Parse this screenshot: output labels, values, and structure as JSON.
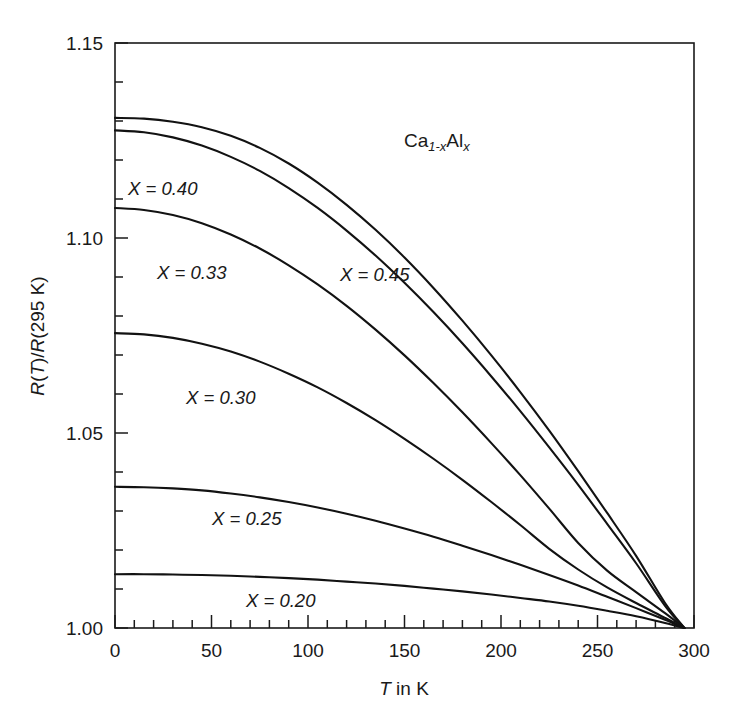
{
  "chart_data": {
    "type": "line",
    "title": "",
    "xlabel": "T in K",
    "ylabel": "R(T)/R(295 K)",
    "xlim": [
      0,
      300
    ],
    "ylim": [
      1.0,
      1.15
    ],
    "grid": false,
    "legend_position": "inline-annotations",
    "x_ticks_major": [
      0,
      50,
      100,
      150,
      200,
      250,
      300
    ],
    "x_tick_labels": [
      "0",
      "50",
      "100",
      "150",
      "200",
      "250",
      "300"
    ],
    "x_minor_step": 10,
    "y_ticks_major": [
      1.0,
      1.05,
      1.1,
      1.15
    ],
    "y_tick_labels": [
      "1.00",
      "1.05",
      "1.10",
      "1.15"
    ],
    "y_minor_step": 0.01,
    "annotation": "Ca1-xAlx",
    "annotation_parts": {
      "base1": "Ca",
      "sub1": "1-x",
      "base2": "Al",
      "sub2": "x"
    },
    "normalization_point": {
      "x": 295,
      "y": 1.0
    },
    "x": [
      0,
      15,
      30,
      45,
      60,
      75,
      90,
      105,
      120,
      135,
      150,
      165,
      180,
      195,
      210,
      225,
      240,
      255,
      270,
      285,
      295
    ],
    "series": [
      {
        "name": "X = 0.45",
        "label": "X = 0.45",
        "x_value": 0.45,
        "values": [
          1.1308,
          1.1306,
          1.1298,
          1.1284,
          1.1262,
          1.1231,
          1.1191,
          1.1142,
          1.1085,
          1.1021,
          1.095,
          1.0872,
          1.0788,
          1.0699,
          1.0605,
          1.0506,
          1.0402,
          1.0295,
          1.0185,
          1.0064,
          1.0
        ]
      },
      {
        "name": "X = 0.40",
        "label": "X = 0.40",
        "x_value": 0.4,
        "values": [
          1.1276,
          1.1271,
          1.1258,
          1.1237,
          1.1208,
          1.1172,
          1.1128,
          1.1077,
          1.1019,
          1.0955,
          1.0885,
          1.081,
          1.073,
          1.0645,
          1.0556,
          1.0463,
          1.0367,
          1.0267,
          1.0166,
          1.0057,
          1.0
        ]
      },
      {
        "name": "X = 0.33",
        "label": "X = 0.33",
        "x_value": 0.33,
        "values": [
          1.1077,
          1.1072,
          1.1059,
          1.1038,
          1.1009,
          1.0973,
          1.093,
          1.0881,
          1.0826,
          1.0765,
          1.0699,
          1.0628,
          1.0553,
          1.0474,
          1.0392,
          1.0306,
          1.0218,
          1.0147,
          1.0092,
          1.0038,
          1.0
        ]
      },
      {
        "name": "X = 0.30",
        "label": "X = 0.30",
        "x_value": 0.3,
        "values": [
          1.0756,
          1.0753,
          1.0744,
          1.0729,
          1.0709,
          1.0683,
          1.0652,
          1.0617,
          1.0577,
          1.0533,
          1.0485,
          1.0434,
          1.038,
          1.0323,
          1.0264,
          1.0203,
          1.015,
          1.0104,
          1.0064,
          1.0026,
          1.0
        ]
      },
      {
        "name": "X = 0.25",
        "label": "X = 0.25",
        "x_value": 0.25,
        "values": [
          1.0362,
          1.0361,
          1.0358,
          1.0353,
          1.0345,
          1.0335,
          1.0323,
          1.0309,
          1.0293,
          1.0275,
          1.0255,
          1.0234,
          1.0211,
          1.0187,
          1.0162,
          1.0136,
          1.0109,
          1.008,
          1.0051,
          1.0021,
          1.0
        ]
      },
      {
        "name": "X = 0.20",
        "label": "X = 0.20",
        "x_value": 0.2,
        "values": [
          1.0138,
          1.0138,
          1.0137,
          1.0136,
          1.0134,
          1.0131,
          1.0128,
          1.0124,
          1.0119,
          1.0114,
          1.0108,
          1.0101,
          1.0094,
          1.0086,
          1.0077,
          1.0068,
          1.0057,
          1.0044,
          1.003,
          1.0013,
          1.0
        ]
      }
    ]
  },
  "labels": {
    "curve_045": "X = 0.45",
    "curve_040": "X = 0.40",
    "curve_033": "X = 0.33",
    "curve_030": "X = 0.30",
    "curve_025": "X = 0.25",
    "curve_020": "X = 0.20",
    "sample_base1": "Ca",
    "sample_sub1": "1-x",
    "sample_base2": "Al",
    "sample_sub2": "x",
    "x_axis_italic": "T",
    "x_axis_rest": " in K",
    "y_axis_text": "R(T)/R(295 K)"
  }
}
